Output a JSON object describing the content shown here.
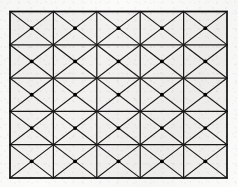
{
  "figure": {
    "background_color": "#fbfbfa",
    "cell_fill_color": "#f2f1ef",
    "line_color": "#1a1a1a",
    "border_color": "#111111",
    "dot_color": "#000000",
    "columns": 5,
    "rows": 5,
    "cell_count": 25,
    "diagonals_per_cell": 2,
    "dots_per_cell": 1,
    "geometry": {
      "x0": 10,
      "y0": 11.5,
      "x1": 227,
      "y1": 178,
      "width": 217,
      "height": 166.5,
      "cell_width": 43.4,
      "cell_height": 33.3,
      "border_stroke_width": 1.7,
      "grid_stroke_width": 1.25,
      "diagonal_stroke_width": 1.15,
      "dot_radius": 1.9
    },
    "column_x": [
      10,
      53.4,
      96.8,
      140.2,
      183.6,
      227
    ],
    "row_y": [
      11.5,
      44.8,
      78.1,
      111.4,
      144.7,
      178
    ],
    "centers_x": [
      31.7,
      75.1,
      118.5,
      161.9,
      205.3
    ],
    "centers_y": [
      28.15,
      61.45,
      94.75,
      128.05,
      161.35
    ]
  }
}
